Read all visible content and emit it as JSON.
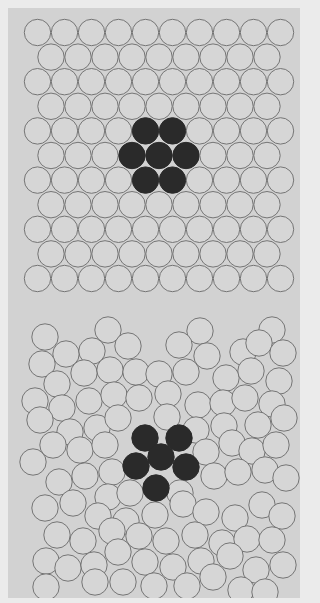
{
  "figure": {
    "colors": {
      "background": "#d2d2d2",
      "page": "#ebebeb",
      "circle_fill": "#d6d6d6",
      "circle_stroke": "#6a6a6a",
      "dark_fill": "#2a2a2a"
    },
    "radius": 13.2,
    "top_panel": {
      "label": "ordered-lattice",
      "row_start_y": 32.5,
      "row_spacing": 24.6,
      "rows": 11,
      "even_start_x": 37.5,
      "odd_start_x": 51,
      "step_x": 27,
      "even_count": 10,
      "odd_count": 9,
      "dark": [
        [
          4,
          4
        ],
        [
          4,
          5
        ],
        [
          5,
          3
        ],
        [
          5,
          4
        ],
        [
          5,
          5
        ],
        [
          6,
          4
        ],
        [
          6,
          5
        ]
      ]
    },
    "bottom_panel": {
      "label": "disordered-packing",
      "circles": [
        [
          45,
          337
        ],
        [
          108,
          330
        ],
        [
          200,
          331
        ],
        [
          272,
          330
        ],
        [
          66,
          354
        ],
        [
          92,
          351
        ],
        [
          128,
          346
        ],
        [
          179,
          345
        ],
        [
          207,
          356
        ],
        [
          243,
          352
        ],
        [
          259,
          343
        ],
        [
          283,
          353
        ],
        [
          42,
          364
        ],
        [
          57,
          384
        ],
        [
          84,
          373
        ],
        [
          110,
          370
        ],
        [
          136,
          372
        ],
        [
          159,
          374
        ],
        [
          186,
          372
        ],
        [
          226,
          378
        ],
        [
          251,
          371
        ],
        [
          279,
          381
        ],
        [
          35,
          401
        ],
        [
          62,
          408
        ],
        [
          89,
          401
        ],
        [
          114,
          395
        ],
        [
          139,
          398
        ],
        [
          168,
          394
        ],
        [
          198,
          405
        ],
        [
          223,
          403
        ],
        [
          245,
          398
        ],
        [
          272,
          404
        ],
        [
          40,
          420
        ],
        [
          70,
          432
        ],
        [
          97,
          428
        ],
        [
          118,
          418
        ],
        [
          167,
          417
        ],
        [
          196,
          430
        ],
        [
          224,
          426
        ],
        [
          258,
          425
        ],
        [
          284,
          418
        ],
        [
          33,
          462
        ],
        [
          53,
          445
        ],
        [
          80,
          450
        ],
        [
          105,
          445
        ],
        [
          112,
          472
        ],
        [
          206,
          452
        ],
        [
          232,
          443
        ],
        [
          252,
          451
        ],
        [
          276,
          445
        ],
        [
          59,
          482
        ],
        [
          85,
          476
        ],
        [
          108,
          497
        ],
        [
          130,
          493
        ],
        [
          180,
          493
        ],
        [
          214,
          476
        ],
        [
          238,
          472
        ],
        [
          265,
          470
        ],
        [
          286,
          478
        ],
        [
          45,
          508
        ],
        [
          73,
          503
        ],
        [
          98,
          516
        ],
        [
          126,
          521
        ],
        [
          155,
          515
        ],
        [
          183,
          504
        ],
        [
          206,
          512
        ],
        [
          235,
          518
        ],
        [
          262,
          505
        ],
        [
          282,
          516
        ],
        [
          57,
          535
        ],
        [
          83,
          541
        ],
        [
          112,
          531
        ],
        [
          139,
          536
        ],
        [
          166,
          541
        ],
        [
          195,
          535
        ],
        [
          222,
          543
        ],
        [
          247,
          539
        ],
        [
          272,
          540
        ],
        [
          46,
          561
        ],
        [
          68,
          568
        ],
        [
          94,
          565
        ],
        [
          118,
          552
        ],
        [
          145,
          562
        ],
        [
          173,
          567
        ],
        [
          201,
          561
        ],
        [
          230,
          556
        ],
        [
          256,
          570
        ],
        [
          283,
          565
        ],
        [
          46,
          587
        ],
        [
          95,
          582
        ],
        [
          123,
          582
        ],
        [
          154,
          586
        ],
        [
          187,
          586
        ],
        [
          213,
          577
        ],
        [
          241,
          590
        ],
        [
          265,
          592
        ]
      ],
      "dark": [
        [
          145,
          438
        ],
        [
          179,
          438
        ],
        [
          161,
          457
        ],
        [
          136,
          466
        ],
        [
          186,
          467
        ],
        [
          156,
          488
        ]
      ]
    }
  }
}
